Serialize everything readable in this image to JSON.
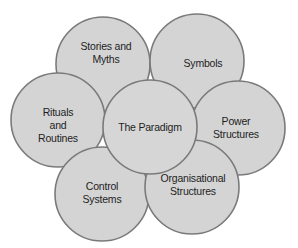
{
  "diagram": {
    "colors": {
      "fill": "#d4d4d4",
      "stroke": "#7a7a7a",
      "text": "#1e1e1e",
      "background": "#ffffff"
    },
    "center": {
      "label_lines": [
        "The Paradigm"
      ]
    },
    "nodes": [
      {
        "id": "stories",
        "label_lines": [
          "Stories and",
          "Myths"
        ]
      },
      {
        "id": "symbols",
        "label_lines": [
          "Symbols"
        ]
      },
      {
        "id": "rituals",
        "label_lines": [
          "Rituals",
          "and",
          "Routines"
        ]
      },
      {
        "id": "power",
        "label_lines": [
          "Power",
          "Structures"
        ]
      },
      {
        "id": "control",
        "label_lines": [
          "Control",
          "Systems"
        ]
      },
      {
        "id": "organisational",
        "label_lines": [
          "Organisational",
          "Structures"
        ]
      }
    ]
  }
}
